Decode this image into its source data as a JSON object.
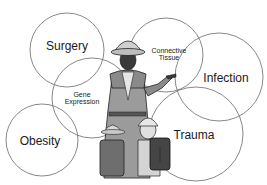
{
  "diagram": {
    "title": "",
    "colors": {
      "circle_stroke": "#7a7a7a",
      "text": "#1a1a1a"
    },
    "figure": {
      "icon": "explorer-guide-with-children-illustration",
      "description": "Illustrated guide in pith helmet pointing, with two children wearing helmets and backpacks"
    },
    "circles": [
      {
        "id": "surgery",
        "label": "Surgery",
        "cx": 67,
        "cy": 50,
        "r": 37
      },
      {
        "id": "gene-expression",
        "label_line1": "Gene",
        "label_line2": "Expression",
        "cx": 92,
        "cy": 98,
        "r": 40
      },
      {
        "id": "connective-tissue",
        "label_line1": "Connective",
        "label_line2": "Tissue",
        "cx": 166,
        "cy": 55,
        "r": 37
      },
      {
        "id": "infection",
        "label": "Infection",
        "cx": 219,
        "cy": 77,
        "r": 44
      },
      {
        "id": "obesity",
        "label": "Obesity",
        "cx": 42,
        "cy": 140,
        "r": 36
      },
      {
        "id": "trauma",
        "label": "Trauma",
        "cx": 196,
        "cy": 134,
        "r": 47
      }
    ]
  }
}
